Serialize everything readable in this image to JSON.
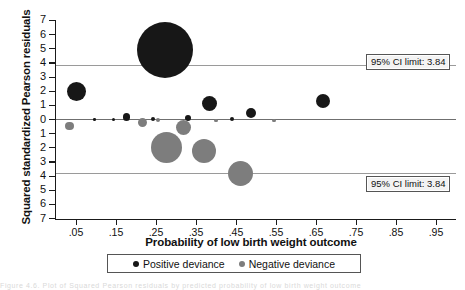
{
  "chart_data": {
    "type": "scatter",
    "title": "",
    "xlabel": "Probability of low birth weight outcome",
    "ylabel": "Squared standardized Pearson residuals",
    "xlim": [
      0.0,
      1.0
    ],
    "ylim": [
      -7,
      7
    ],
    "grid": false,
    "xticks": [
      ".05",
      ".15",
      ".25",
      ".35",
      ".45",
      ".55",
      ".65",
      ".75",
      ".85",
      ".95"
    ],
    "xtick_values": [
      0.05,
      0.15,
      0.25,
      0.35,
      0.45,
      0.55,
      0.65,
      0.75,
      0.85,
      0.95
    ],
    "yticks": [
      "7",
      "6",
      "5",
      "4",
      "3",
      "2",
      "1",
      "0",
      "1",
      "2",
      "3",
      "4",
      "5",
      "6",
      "7"
    ],
    "ytick_values": [
      7,
      6,
      5,
      4,
      3,
      2,
      1,
      0,
      -1,
      -2,
      -3,
      -4,
      -5,
      -6,
      -7
    ],
    "reference_lines": [
      {
        "value": 3.84,
        "label": "95% CI limit: 3.84"
      },
      {
        "value": 0,
        "label": ""
      },
      {
        "value": -3.84,
        "label": "95% CI limit: 3.84"
      }
    ],
    "legend": {
      "position": "bottom",
      "entries": [
        {
          "name": "Positive deviance",
          "color": "#171717"
        },
        {
          "name": "Negative deviance",
          "color": "#7d7d7d"
        }
      ]
    },
    "series": [
      {
        "name": "Positive deviance",
        "color": "#171717",
        "points": [
          {
            "x": 0.272,
            "y": 4.9,
            "size": 28.0
          },
          {
            "x": 0.05,
            "y": 1.95,
            "size": 9.5
          },
          {
            "x": 0.383,
            "y": 1.15,
            "size": 7.5
          },
          {
            "x": 0.487,
            "y": 0.45,
            "size": 5.0
          },
          {
            "x": 0.668,
            "y": 1.3,
            "size": 7.0
          },
          {
            "x": 0.176,
            "y": 0.18,
            "size": 3.6
          },
          {
            "x": 0.243,
            "y": 0.02,
            "size": 2.0
          },
          {
            "x": 0.33,
            "y": 0.1,
            "size": 3.2
          },
          {
            "x": 0.439,
            "y": 0.03,
            "size": 2.0
          },
          {
            "x": 0.096,
            "y": 0.02,
            "size": 1.3
          },
          {
            "x": 0.143,
            "y": 0.02,
            "size": 1.6
          }
        ]
      },
      {
        "name": "Negative deviance",
        "color": "#7d7d7d",
        "points": [
          {
            "x": 0.034,
            "y": -0.45,
            "size": 4.2
          },
          {
            "x": 0.216,
            "y": -0.22,
            "size": 4.5
          },
          {
            "x": 0.277,
            "y": -1.95,
            "size": 15.5
          },
          {
            "x": 0.318,
            "y": -0.55,
            "size": 7.5
          },
          {
            "x": 0.37,
            "y": -2.25,
            "size": 12.0
          },
          {
            "x": 0.46,
            "y": -3.8,
            "size": 12.5
          },
          {
            "x": 0.256,
            "y": -0.05,
            "size": 2.0
          },
          {
            "x": 0.4,
            "y": -0.08,
            "size": 1.8
          },
          {
            "x": 0.545,
            "y": -0.05,
            "size": 1.6
          }
        ]
      }
    ]
  },
  "annotations": {
    "ci_top": "95% CI limit: 3.84",
    "ci_bottom": "95% CI limit: 3.84"
  },
  "footer": {
    "caption_fragment": "Figure 4.6. Plot of Squared Pearson residuals by predicted probability of low birth weight outcome"
  }
}
